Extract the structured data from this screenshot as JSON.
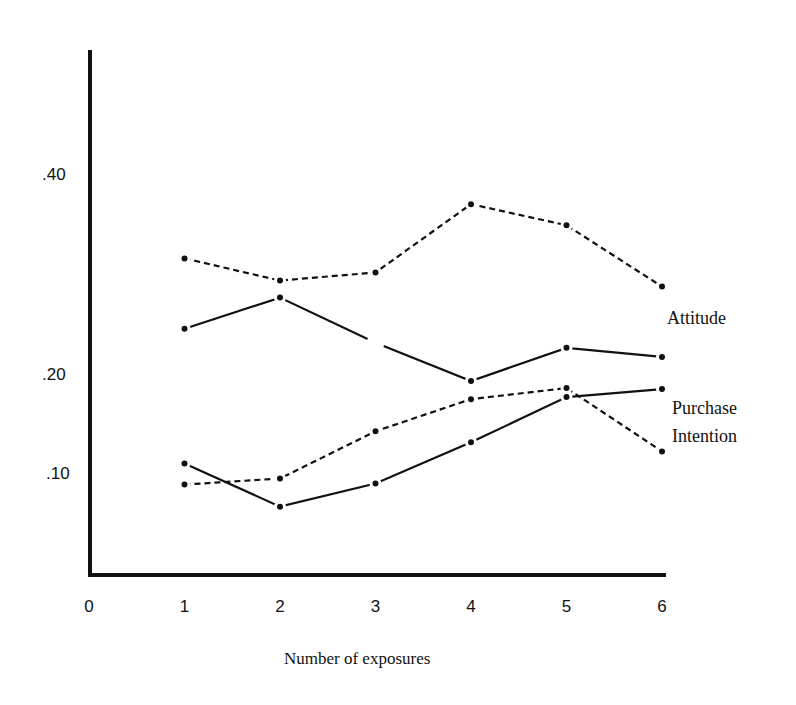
{
  "chart_data": {
    "type": "line",
    "title": "",
    "xlabel": "Number of exposures",
    "ylabel": "",
    "x": [
      1,
      2,
      3,
      4,
      5,
      6
    ],
    "xticks": [
      "0",
      "1",
      "2",
      "3",
      "4",
      "5",
      "6"
    ],
    "yticks": [
      ".40",
      ".20",
      ".10"
    ],
    "ytick_values": [
      0.4,
      0.2,
      0.1
    ],
    "xlim": [
      0,
      6
    ],
    "ylim": [
      0,
      0.52
    ],
    "grid": false,
    "legend": "inline labels at right",
    "series": [
      {
        "name": "Attitude (dashed)",
        "group": "Attitude",
        "style": "dashed",
        "values": [
          0.315,
          0.293,
          0.301,
          0.369,
          0.348,
          0.287
        ]
      },
      {
        "name": "Attitude (solid)",
        "group": "Attitude",
        "style": "solid",
        "values": [
          0.245,
          0.276,
          0.231,
          0.193,
          0.226,
          0.217
        ],
        "missing_marker_at": [
          3
        ]
      },
      {
        "name": "Purchase Intention (dashed)",
        "group": "Purchase Intention",
        "style": "dashed",
        "values": [
          0.09,
          0.096,
          0.143,
          0.175,
          0.186,
          0.123
        ]
      },
      {
        "name": "Purchase Intention (solid)",
        "group": "Purchase Intention",
        "style": "solid",
        "values": [
          0.111,
          0.068,
          0.091,
          0.132,
          0.177,
          0.185
        ]
      }
    ],
    "annotations": [
      "Attitude",
      "Purchase",
      "Intention"
    ]
  },
  "labels": {
    "xlabel": "Number of exposures",
    "attitude": "Attitude",
    "purchase_line1": "Purchase",
    "purchase_line2": "Intention",
    "xticks": [
      "0",
      "1",
      "2",
      "3",
      "4",
      "5",
      "6"
    ],
    "yticks": [
      ".40",
      ".20",
      ".10"
    ]
  }
}
